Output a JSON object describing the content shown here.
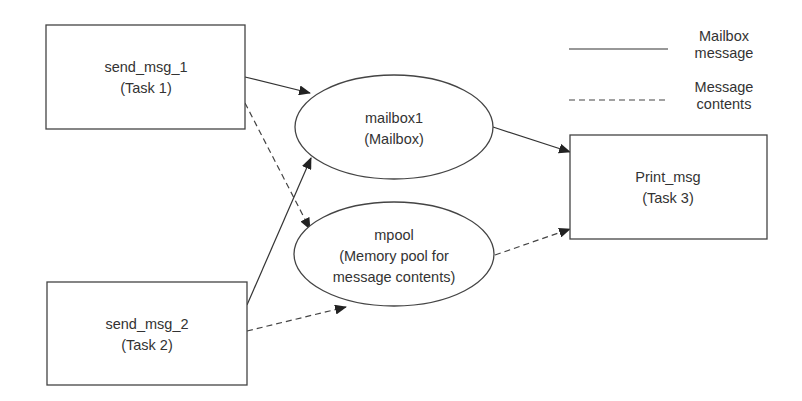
{
  "diagram": {
    "nodes": {
      "send_msg_1": {
        "line1": "send_msg_1",
        "line2": "(Task 1)"
      },
      "send_msg_2": {
        "line1": "send_msg_2",
        "line2": "(Task 2)"
      },
      "mailbox1": {
        "line1": "mailbox1",
        "line2": "(Mailbox)"
      },
      "mpool": {
        "line1": "mpool",
        "line2": "(Memory pool for",
        "line3": "message contents)"
      },
      "print_msg": {
        "line1": "Print_msg",
        "line2": "(Task 3)"
      }
    },
    "edges": [
      {
        "from": "send_msg_1",
        "to": "mailbox1",
        "style": "solid"
      },
      {
        "from": "send_msg_1",
        "to": "mpool",
        "style": "dashed"
      },
      {
        "from": "send_msg_2",
        "to": "mailbox1",
        "style": "solid"
      },
      {
        "from": "send_msg_2",
        "to": "mpool",
        "style": "dashed"
      },
      {
        "from": "mailbox1",
        "to": "print_msg",
        "style": "solid"
      },
      {
        "from": "mpool",
        "to": "print_msg",
        "style": "dashed"
      }
    ],
    "legend": {
      "solid": {
        "line1": "Mailbox",
        "line2": "message"
      },
      "dashed": {
        "line1": "Message",
        "line2": "contents"
      }
    },
    "colors": {
      "stroke": "#444444",
      "text": "#333333",
      "background": "#ffffff"
    }
  }
}
